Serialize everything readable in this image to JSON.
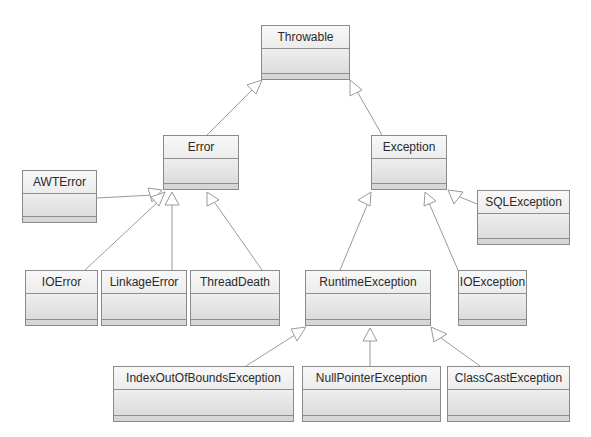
{
  "diagram": {
    "type": "uml-class-hierarchy",
    "classes": [
      {
        "id": "throwable",
        "name": "Throwable",
        "x": 261,
        "y": 25,
        "w": 89,
        "h": 55
      },
      {
        "id": "error",
        "name": "Error",
        "x": 163,
        "y": 135,
        "w": 76,
        "h": 55
      },
      {
        "id": "exception",
        "name": "Exception",
        "x": 371,
        "y": 135,
        "w": 76,
        "h": 55
      },
      {
        "id": "awterror",
        "name": "AWTError",
        "x": 22,
        "y": 170,
        "w": 75,
        "h": 53
      },
      {
        "id": "sqlexception",
        "name": "SQLException",
        "x": 477,
        "y": 190,
        "w": 93,
        "h": 55
      },
      {
        "id": "ioerror",
        "name": "IOError",
        "x": 25,
        "y": 270,
        "w": 73,
        "h": 56
      },
      {
        "id": "linkageerror",
        "name": "LinkageError",
        "x": 101,
        "y": 270,
        "w": 86,
        "h": 56
      },
      {
        "id": "threaddeath",
        "name": "ThreadDeath",
        "x": 190,
        "y": 270,
        "w": 90,
        "h": 56
      },
      {
        "id": "runtimeexception",
        "name": "RuntimeException",
        "x": 305,
        "y": 270,
        "w": 126,
        "h": 56
      },
      {
        "id": "ioexception",
        "name": "IOException",
        "x": 458,
        "y": 270,
        "w": 69,
        "h": 56
      },
      {
        "id": "indexoutofboundsexception",
        "name": "IndexOutOfBoundsException",
        "x": 113,
        "y": 366,
        "w": 181,
        "h": 56
      },
      {
        "id": "nullpointerexception",
        "name": "NullPointerException",
        "x": 302,
        "y": 366,
        "w": 139,
        "h": 56
      },
      {
        "id": "classcastexception",
        "name": "ClassCastException",
        "x": 447,
        "y": 366,
        "w": 123,
        "h": 56
      }
    ],
    "generalizations": [
      {
        "child": "Error",
        "parent": "Throwable"
      },
      {
        "child": "Exception",
        "parent": "Throwable"
      },
      {
        "child": "AWTError",
        "parent": "Error"
      },
      {
        "child": "IOError",
        "parent": "Error"
      },
      {
        "child": "LinkageError",
        "parent": "Error"
      },
      {
        "child": "ThreadDeath",
        "parent": "Error"
      },
      {
        "child": "SQLException",
        "parent": "Exception"
      },
      {
        "child": "RuntimeException",
        "parent": "Exception"
      },
      {
        "child": "IOException",
        "parent": "Exception"
      },
      {
        "child": "IndexOutOfBoundsException",
        "parent": "RuntimeException"
      },
      {
        "child": "NullPointerException",
        "parent": "RuntimeException"
      },
      {
        "child": "ClassCastException",
        "parent": "RuntimeException"
      }
    ],
    "colors": {
      "box_border": "#8a8a8a",
      "box_fill": "#eeeeee",
      "edge": "#9a9a9a",
      "text": "#2a2a2a"
    }
  }
}
